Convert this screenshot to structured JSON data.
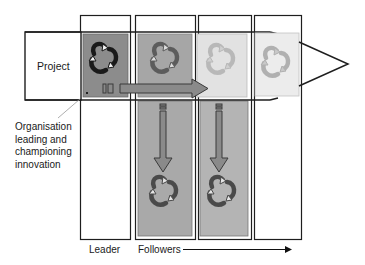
{
  "diagram": {
    "type": "innovation-diffusion",
    "project_label": "Project",
    "org_label_lines": [
      "Organisation",
      "leading and",
      "championing",
      "innovation"
    ],
    "leader_label": "Leader",
    "followers_label": "Followers",
    "columns": [
      {
        "role": "leader",
        "project_cell_shade": "#8c8c8c",
        "lower_cell": false
      },
      {
        "role": "follower",
        "project_cell_shade": "#a6a6a6",
        "lower_cell": true,
        "lower_cell_shade": "#a9a9a9"
      },
      {
        "role": "follower",
        "project_cell_shade": "#e2e2e2",
        "lower_cell": true,
        "lower_cell_shade": "#b4b4b4"
      },
      {
        "role": "follower",
        "project_cell_shade": "#ececec",
        "lower_cell": false
      }
    ],
    "icons": {
      "cycle": "recycle-cycle-icon",
      "horizontal_arrow": "arrow-right-icon",
      "vertical_arrow": "arrow-down-icon"
    },
    "colors": {
      "border": "#1e1e1e",
      "arrow_fill": "#8a8a8a",
      "arrow_stroke": "#3a3a3a"
    }
  }
}
